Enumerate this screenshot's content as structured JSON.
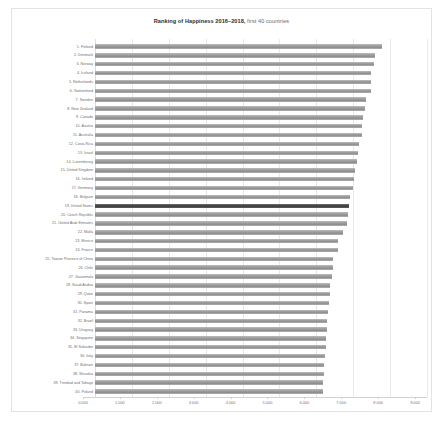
{
  "chart_data": {
    "type": "bar",
    "orientation": "horizontal",
    "title_bold_part": "Ranking of Happiness 2016–2018,",
    "title_rest_part": " first 40 countries",
    "xlabel": "",
    "ylabel": "",
    "xlim": [
      0.0,
      9.0
    ],
    "grid": true,
    "legend": "none",
    "highlight_category": "19. United States",
    "highlight_color": "#4a4a4a",
    "bar_color": "#9f9f9f",
    "xticks": [
      "0.000",
      "1.000",
      "2.000",
      "3.000",
      "4.000",
      "5.000",
      "6.000",
      "7.000",
      "8.000",
      "9.000"
    ],
    "xtick_values": [
      0,
      1,
      2,
      3,
      4,
      5,
      6,
      7,
      8,
      9
    ],
    "categories": [
      "1. Finland",
      "2. Denmark",
      "3. Norway",
      "4. Iceland",
      "5. Netherlands",
      "6. Switzerland",
      "7. Sweden",
      "8. New Zealand",
      "9. Canada",
      "10. Austria",
      "11. Australia",
      "12. Costa Rica",
      "13. Israel",
      "14. Luxembourg",
      "15. United Kingdom",
      "16. Ireland",
      "17. Germany",
      "18. Belgium",
      "19. United States",
      "20. Czech Republic",
      "21. United Arab Emirates",
      "22. Malta",
      "23. Mexico",
      "24. France",
      "25. Taiwan Province of China",
      "26. Chile",
      "27. Guatemala",
      "28. Saudi Arabia",
      "29. Qatar",
      "30. Spain",
      "31. Panama",
      "32. Brazil",
      "33. Uruguay",
      "34. Singapore",
      "35. El Salvador",
      "36. Italy",
      "37. Bahrain",
      "38. Slovakia",
      "39. Trinidad and Tobago",
      "40. Poland"
    ],
    "values": [
      7.769,
      7.6,
      7.554,
      7.494,
      7.488,
      7.48,
      7.343,
      7.307,
      7.278,
      7.246,
      7.228,
      7.167,
      7.139,
      7.09,
      7.054,
      7.021,
      6.985,
      6.923,
      6.892,
      6.852,
      6.825,
      6.726,
      6.595,
      6.592,
      6.446,
      6.444,
      6.436,
      6.375,
      6.374,
      6.354,
      6.321,
      6.3,
      6.293,
      6.262,
      6.253,
      6.223,
      6.199,
      6.198,
      6.192,
      6.182
    ]
  }
}
